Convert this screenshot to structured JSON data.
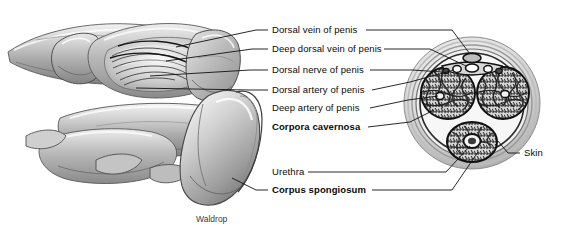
{
  "figure": {
    "credit": "Waldrop",
    "background_color": "#ffffff",
    "ink_color": "#111111"
  },
  "labels": [
    {
      "id": "dorsal-vein",
      "text": "Dorsal vein of penis",
      "bold": false,
      "x": 272,
      "y": 26
    },
    {
      "id": "deep-dorsal-vein",
      "text": "Deep dorsal vein of penis",
      "bold": false,
      "x": 272,
      "y": 45
    },
    {
      "id": "dorsal-nerve",
      "text": "Dorsal nerve of penis",
      "bold": false,
      "x": 272,
      "y": 66
    },
    {
      "id": "dorsal-artery",
      "text": "Dorsal artery of penis",
      "bold": false,
      "x": 272,
      "y": 86
    },
    {
      "id": "deep-artery",
      "text": "Deep artery of penis",
      "bold": false,
      "x": 272,
      "y": 104
    },
    {
      "id": "corpora-cavernosa",
      "text": "Corpora cavernosa",
      "bold": true,
      "x": 272,
      "y": 123
    },
    {
      "id": "urethra",
      "text": "Urethra",
      "bold": false,
      "x": 272,
      "y": 168
    },
    {
      "id": "corpus-spongiosum",
      "text": "Corpus spongiosum",
      "bold": true,
      "x": 272,
      "y": 186
    },
    {
      "id": "skin",
      "text": "Skin",
      "bold": false,
      "x": 522,
      "y": 150
    }
  ],
  "cross_section": {
    "name": "penis-cross-section",
    "center_x": 472,
    "center_y": 103,
    "structures": [
      "corpus-cavernosum-left",
      "corpus-cavernosum-right",
      "corpus-spongiosum",
      "urethra",
      "deep-artery-left",
      "deep-artery-right",
      "dorsal-vein",
      "deep-dorsal-vein",
      "dorsal-arteries",
      "dorsal-nerves",
      "tunica-albuginea",
      "buck-fascia",
      "skin"
    ]
  },
  "longitudinal_view": {
    "name": "penis-dissection-illustration",
    "description": "Shaded dissection drawing of the penis shaft and glans with retracted fascia"
  }
}
